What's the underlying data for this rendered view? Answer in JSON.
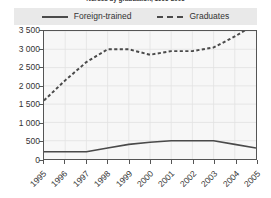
{
  "title": "Nurses by graduation, 1995-2005",
  "legend": {
    "position": "top",
    "entries": [
      {
        "label": "Foreign-trained",
        "style": "solid",
        "swatch": "solid-line-swatch"
      },
      {
        "label": "Graduates",
        "style": "dashed",
        "swatch": "dashed-line-swatch"
      }
    ]
  },
  "chart_data": {
    "type": "line",
    "title": "Nurses by graduation, 1995-2005",
    "xlabel": "",
    "ylabel": "",
    "x": [
      "1995",
      "1996",
      "1997",
      "1998",
      "1999",
      "2000",
      "2001",
      "2002",
      "2003",
      "2004",
      "2005"
    ],
    "categories": [
      "1995",
      "1996",
      "1997",
      "1998",
      "1999",
      "2000",
      "2001",
      "2002",
      "2003",
      "2004",
      "2005"
    ],
    "series": [
      {
        "name": "Foreign-trained",
        "style": "solid",
        "color": "#4a4a4a",
        "values": [
          200,
          200,
          200,
          300,
          400,
          460,
          500,
          500,
          500,
          400,
          300
        ]
      },
      {
        "name": "Graduates",
        "style": "dashed",
        "color": "#4a4a4a",
        "values": [
          1600,
          2150,
          2650,
          3000,
          3000,
          2850,
          2950,
          2950,
          3050,
          3350,
          3700
        ]
      }
    ],
    "ylim": [
      0,
      3500
    ],
    "xlim": [
      "1995",
      "2005"
    ],
    "ytick_values": [
      0,
      500,
      1000,
      1500,
      2000,
      2500,
      3000,
      3500
    ],
    "ytick_labels": [
      "0",
      "500",
      "1 000",
      "1 500",
      "2 000",
      "2 500",
      "3 000",
      "3 500"
    ],
    "grid": true,
    "legend_position": "top"
  },
  "colors": {
    "line": "#4a4a4a",
    "axis": "#555555",
    "plot_background": "#f7f7f7",
    "grid": "#e2e2e2",
    "legend_background": "#e9e9e9",
    "text": "#333333"
  }
}
